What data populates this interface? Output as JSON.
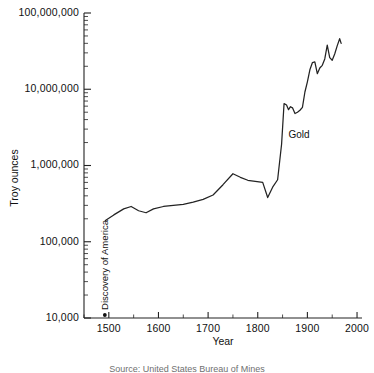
{
  "figure": {
    "caption": "Source: United States Bureau of Mines"
  },
  "chart_data": {
    "type": "line",
    "title": "",
    "xlabel": "Year",
    "ylabel": "Troy ounces",
    "xlim": [
      1450,
      2010
    ],
    "ylim": [
      10000,
      100000000
    ],
    "yscale": "log",
    "grid": false,
    "legend_position": "inline-label",
    "xticks": [
      1500,
      1600,
      1700,
      1800,
      1900,
      2000
    ],
    "xtick_labels": [
      "1500",
      "1600",
      "1700",
      "1800",
      "1900",
      "2000"
    ],
    "yticks": [
      10000,
      100000,
      1000000,
      10000000,
      100000000
    ],
    "ytick_labels": [
      "10,000",
      "100,000",
      "1,000,000",
      "10,000,000",
      "100,000,000"
    ],
    "annotations": [
      {
        "text": "Discovery of America",
        "x": 1492,
        "y": 10000,
        "rotation": -90
      },
      {
        "text": "Gold",
        "x": 1862,
        "y": 2300000,
        "rotation": 0
      }
    ],
    "series": [
      {
        "name": "Gold",
        "x": [
          1493,
          1510,
          1530,
          1545,
          1560,
          1575,
          1590,
          1610,
          1630,
          1650,
          1670,
          1690,
          1710,
          1730,
          1750,
          1765,
          1780,
          1795,
          1810,
          1820,
          1830,
          1840,
          1848,
          1853,
          1858,
          1862,
          1866,
          1870,
          1875,
          1880,
          1885,
          1890,
          1895,
          1900,
          1905,
          1910,
          1915,
          1920,
          1925,
          1930,
          1935,
          1940,
          1945,
          1950,
          1955,
          1960,
          1965,
          1968
        ],
        "y": [
          190000,
          225000,
          270000,
          290000,
          255000,
          240000,
          270000,
          290000,
          300000,
          310000,
          330000,
          360000,
          410000,
          560000,
          780000,
          700000,
          640000,
          620000,
          600000,
          380000,
          520000,
          650000,
          1900000,
          6500000,
          6200000,
          5400000,
          5900000,
          5700000,
          4800000,
          5000000,
          5300000,
          5800000,
          9200000,
          12500000,
          18000000,
          22300000,
          22800000,
          16000000,
          19000000,
          20600000,
          25000000,
          38000000,
          26000000,
          24000000,
          29000000,
          37000000,
          46000000,
          40000000
        ]
      }
    ]
  }
}
